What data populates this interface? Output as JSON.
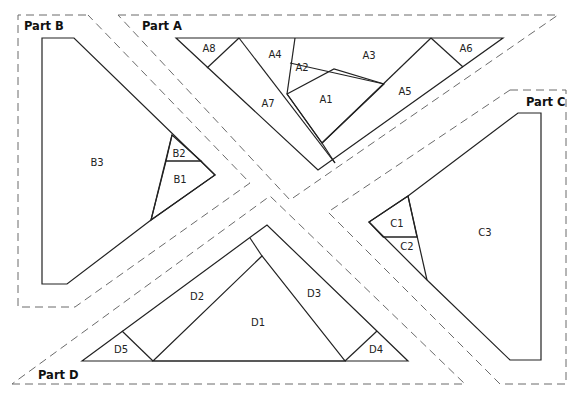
{
  "colors": {
    "outline": "#222222",
    "seam_allowance": "#6b6b6b",
    "shaded_piece": "#d9d9d9",
    "light_piece": "#f2f2f2",
    "background": "#ffffff"
  },
  "parts": {
    "A": {
      "title": "Part A",
      "pieces": [
        "A1",
        "A2",
        "A3",
        "A4",
        "A5",
        "A6",
        "A7",
        "A8"
      ],
      "shaded": [
        "A1"
      ]
    },
    "B": {
      "title": "Part B",
      "pieces": [
        "B1",
        "B2",
        "B3"
      ],
      "shaded": [
        "B2"
      ],
      "light": [
        "B1"
      ]
    },
    "C": {
      "title": "Part C",
      "pieces": [
        "C1",
        "C2",
        "C3"
      ],
      "shaded": [
        "C1"
      ]
    },
    "D": {
      "title": "Part D",
      "pieces": [
        "D1",
        "D2",
        "D3",
        "D4",
        "D5"
      ],
      "light": [
        "D1"
      ]
    }
  },
  "labels": {
    "A1": "A1",
    "A2": "A2",
    "A3": "A3",
    "A4": "A4",
    "A5": "A5",
    "A6": "A6",
    "A7": "A7",
    "A8": "A8",
    "B1": "B1",
    "B2": "B2",
    "B3": "B3",
    "C1": "C1",
    "C2": "C2",
    "C3": "C3",
    "D1": "D1",
    "D2": "D2",
    "D3": "D3",
    "D4": "D4",
    "D5": "D5"
  }
}
